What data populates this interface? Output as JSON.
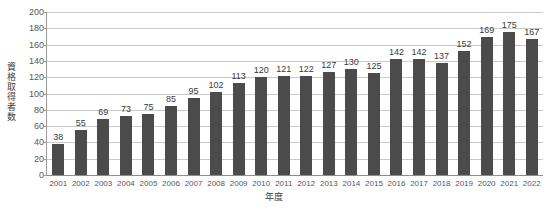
{
  "chart_data": {
    "type": "bar",
    "title": "",
    "subtitle": "",
    "xlabel": "年度",
    "ylabel": "資格取得者数",
    "ylim": [
      0,
      200
    ],
    "ytick_step": 20,
    "yticks": [
      200,
      180,
      160,
      140,
      120,
      100,
      80,
      60,
      40,
      20,
      0
    ],
    "grid": true,
    "legend": false,
    "legend_position": "none",
    "bar_color": "#4b4b4b",
    "gridline_color": "#c9c9c9",
    "axis_color": "#9a9a9a",
    "background_color": "#ffffff",
    "categories": [
      "2001",
      "2002",
      "2003",
      "2004",
      "2005",
      "2006",
      "2007",
      "2008",
      "2009",
      "2010",
      "2011",
      "2012",
      "2013",
      "2014",
      "2015",
      "2016",
      "2017",
      "2018",
      "2019",
      "2020",
      "2021",
      "2022"
    ],
    "values": [
      38,
      55,
      69,
      73,
      75,
      85,
      95,
      102,
      113,
      120,
      121,
      122,
      127,
      130,
      125,
      142,
      142,
      137,
      152,
      169,
      175,
      167
    ],
    "data_labels": [
      "38",
      "55",
      "69",
      "73",
      "75",
      "85",
      "95",
      "102",
      "113",
      "120",
      "121",
      "122",
      "127",
      "130",
      "125",
      "142",
      "142",
      "137",
      "152",
      "169",
      "175",
      "167"
    ]
  }
}
